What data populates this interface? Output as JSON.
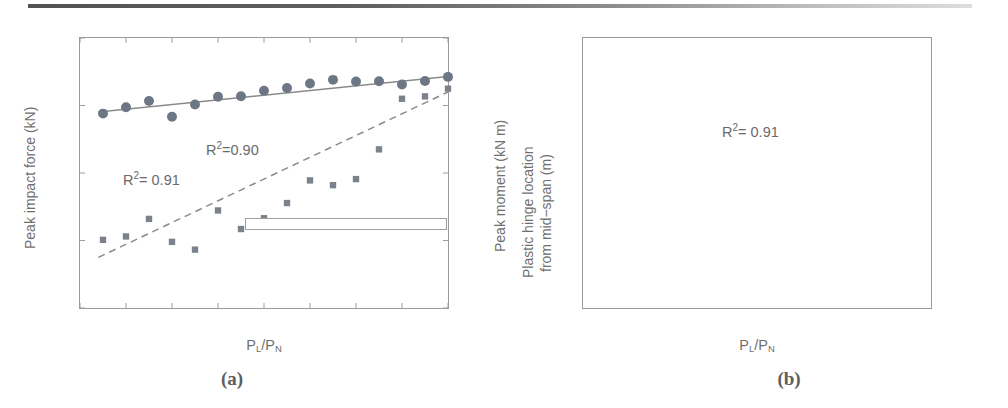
{
  "figure": {
    "caption_a": "(a)",
    "caption_b": "(b)",
    "marker_color_circle": "#6d7684",
    "marker_color_square": "#7b828c",
    "line_color": "#8a8a8a",
    "axis_color": "#9b9b9b",
    "text_color": "#6f6f6f"
  },
  "chart_data": [
    {
      "type": "scatter",
      "panel": "(a)",
      "title": "",
      "xlabel": "PL/PN",
      "xlabel_parts": {
        "base1": "P",
        "sub1": "L",
        "slash": "/",
        "base2": "P",
        "sub2": "N"
      },
      "ylabel": "Peak impact force (kN)",
      "ylabel_right": "Peak moment (kN m)",
      "xlim": [
        0,
        0.8
      ],
      "ylim": [
        0,
        2000
      ],
      "ylim_right": [
        0,
        800
      ],
      "xticks": [
        0,
        0.1,
        0.2,
        0.3,
        0.4,
        0.5,
        0.6,
        0.7,
        0.8
      ],
      "xticklabels": [
        "0",
        "0.1",
        "0.2",
        "0.3",
        "0.4",
        "0.5",
        "0.6",
        "0.7",
        "0.8"
      ],
      "yticks": [
        0,
        500,
        1000,
        1500,
        2000
      ],
      "yticklabels": [
        "0",
        "500",
        "1000",
        "1500",
        "2000"
      ],
      "yticks_right": [
        0,
        200,
        400,
        600,
        800
      ],
      "yticklabels_right": [
        "0",
        "200",
        "400",
        "600",
        "800"
      ],
      "grid": false,
      "legend_position": "lower right",
      "series": [
        {
          "name": "Peak impact force",
          "marker": "circle",
          "axis": "left",
          "x": [
            0.05,
            0.1,
            0.15,
            0.2,
            0.25,
            0.3,
            0.35,
            0.4,
            0.45,
            0.5,
            0.55,
            0.6,
            0.65,
            0.7,
            0.75,
            0.8
          ],
          "y": [
            1440,
            1487,
            1533,
            1417,
            1508,
            1565,
            1568,
            1610,
            1630,
            1663,
            1690,
            1678,
            1680,
            1655,
            1682,
            1712
          ]
        },
        {
          "name": "Fitted for peak impact force",
          "marker": "solid-line",
          "axis": "left",
          "x": [
            0.04,
            0.8
          ],
          "y": [
            1452,
            1715
          ]
        },
        {
          "name": "Peak moment",
          "marker": "square",
          "axis": "right",
          "x": [
            0.05,
            0.1,
            0.15,
            0.2,
            0.25,
            0.3,
            0.35,
            0.4,
            0.45,
            0.5,
            0.55,
            0.6,
            0.65,
            0.7,
            0.75,
            0.8
          ],
          "y": [
            202,
            212,
            264,
            196,
            173,
            289,
            234,
            266,
            311,
            378,
            364,
            382,
            470,
            620,
            627,
            650
          ]
        },
        {
          "name": "Fitted for peak moment",
          "marker": "dashed-line",
          "axis": "right",
          "x": [
            0.04,
            0.8
          ],
          "y": [
            150,
            640
          ]
        }
      ],
      "annotations": [
        {
          "id": "r2-force",
          "prefix": "R",
          "sup": "2",
          "suffix": "=0.90"
        },
        {
          "id": "r2-moment",
          "prefix": "R",
          "sup": "2",
          "suffix": "= 0.91"
        }
      ],
      "legend": [
        {
          "key": "circle",
          "label": "Peak impact force"
        },
        {
          "key": "solid-line",
          "label": "Fitted for peak impact force"
        },
        {
          "key": "square",
          "label": "Peak moment"
        },
        {
          "key": "dashed-line",
          "label": "Fitted for peak moment"
        }
      ]
    },
    {
      "type": "scatter",
      "panel": "(b)",
      "title": "",
      "xlabel": "PL/PN",
      "xlabel_parts": {
        "base1": "P",
        "sub1": "L",
        "slash": "/",
        "base2": "P",
        "sub2": "N"
      },
      "ylabel_line1": "Plastic hinge location",
      "ylabel_line2": "from mid−span (m)",
      "xlim": [
        0,
        0.8
      ],
      "ylim": [
        0,
        0.8
      ],
      "xticks": [
        0,
        0.2,
        0.4,
        0.6,
        0.8
      ],
      "xticklabels": [
        "0",
        "0.2",
        "0.4",
        "0.6",
        "0.8"
      ],
      "yticks": [
        0,
        0.1,
        0.2,
        0.3,
        0.4,
        0.5,
        0.6,
        0.7,
        0.8
      ],
      "yticklabels": [
        "0",
        "0.1",
        "0.2",
        "0.3",
        "0.4",
        "0.5",
        "0.6",
        "0.7",
        "0.8"
      ],
      "grid": false,
      "legend_position": "none",
      "series": [
        {
          "name": "Plastic hinge location",
          "marker": "circle",
          "x": [
            0.05,
            0.1,
            0.15,
            0.2,
            0.25,
            0.3,
            0.35,
            0.4,
            0.45,
            0.5,
            0.55,
            0.6,
            0.65,
            0.7,
            0.75,
            0.8
          ],
          "y": [
            0.74,
            0.72,
            0.543,
            0.463,
            0.322,
            0.444,
            0.342,
            0.343,
            0.365,
            0.325,
            0.305,
            0.267,
            0.306,
            0.247,
            0.19,
            0.005
          ]
        },
        {
          "name": "Fitted line",
          "marker": "solid-line",
          "x": [
            0.07,
            0.8
          ],
          "y": [
            0.632,
            0.108
          ]
        }
      ],
      "annotations": [
        {
          "id": "r2-hinge",
          "prefix": "R",
          "sup": "2",
          "suffix": "= 0.91"
        }
      ]
    }
  ]
}
